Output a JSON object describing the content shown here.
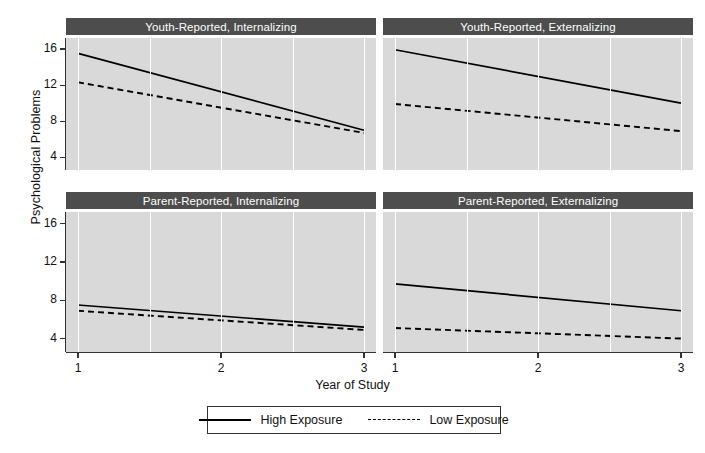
{
  "chart_data": {
    "type": "line",
    "title": "",
    "xlabel": "Year of Study",
    "ylabel": "Psychological Problems",
    "xlim": [
      1,
      3
    ],
    "ylim": [
      2.6,
      17.2
    ],
    "xticks": [
      "1",
      "2",
      "3"
    ],
    "xtick_values": [
      1,
      2,
      3
    ],
    "yticks": [
      "4",
      "8",
      "12",
      "16"
    ],
    "ytick_values": [
      4,
      8,
      12,
      16
    ],
    "grid": "vertical white gridlines at 1, 1.5, 2, 2.5, 3",
    "legend_position": "bottom",
    "legend": [
      {
        "name": "High Exposure",
        "style": "solid"
      },
      {
        "name": "Low Exposure",
        "style": "dashed"
      }
    ],
    "facets": [
      {
        "title": "Youth-Reported, Internalizing",
        "series": [
          {
            "name": "High Exposure",
            "style": "solid",
            "x": [
              1,
              3
            ],
            "values": [
              15.5,
              7.0
            ]
          },
          {
            "name": "Low Exposure",
            "style": "dashed",
            "x": [
              1,
              3
            ],
            "values": [
              12.3,
              6.7
            ]
          }
        ]
      },
      {
        "title": "Youth-Reported, Externalizing",
        "series": [
          {
            "name": "High Exposure",
            "style": "solid",
            "x": [
              1,
              3
            ],
            "values": [
              15.9,
              10.0
            ]
          },
          {
            "name": "Low Exposure",
            "style": "dashed",
            "x": [
              1,
              3
            ],
            "values": [
              9.9,
              6.9
            ]
          }
        ]
      },
      {
        "title": "Parent-Reported, Internalizing",
        "series": [
          {
            "name": "High Exposure",
            "style": "solid",
            "x": [
              1,
              3
            ],
            "values": [
              7.5,
              5.2
            ]
          },
          {
            "name": "Low Exposure",
            "style": "dashed",
            "x": [
              1,
              3
            ],
            "values": [
              6.9,
              4.9
            ]
          }
        ]
      },
      {
        "title": "Parent-Reported, Externalizing",
        "series": [
          {
            "name": "High Exposure",
            "style": "solid",
            "x": [
              1,
              3
            ],
            "values": [
              9.7,
              6.9
            ]
          },
          {
            "name": "Low Exposure",
            "style": "dashed",
            "x": [
              1,
              3
            ],
            "values": [
              5.1,
              4.0
            ]
          }
        ]
      }
    ],
    "colors": {
      "panel_background": "#d9d9d9",
      "strip_background": "#4d4d4d",
      "strip_text": "#ffffff",
      "gridline": "#ffffff",
      "line": "#000000",
      "axis": "#333333",
      "figure_background": "#ffffff"
    }
  }
}
